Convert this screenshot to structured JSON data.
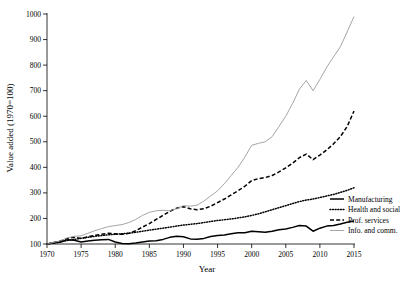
{
  "chart_data": {
    "type": "line",
    "title": "",
    "xlabel": "Year",
    "ylabel": "Value added (1970=100)",
    "xlim": [
      1970,
      2015
    ],
    "ylim": [
      100,
      1000
    ],
    "xticks": [
      1970,
      1975,
      1980,
      1985,
      1990,
      1995,
      2000,
      2005,
      2010,
      2015
    ],
    "yticks": [
      100,
      200,
      300,
      400,
      500,
      600,
      700,
      800,
      900,
      1000
    ],
    "grid": false,
    "legend_position": "right-bottom",
    "x": [
      1970,
      1971,
      1972,
      1973,
      1974,
      1975,
      1976,
      1977,
      1978,
      1979,
      1980,
      1981,
      1982,
      1983,
      1984,
      1985,
      1986,
      1987,
      1988,
      1989,
      1990,
      1991,
      1992,
      1993,
      1994,
      1995,
      1996,
      1997,
      1998,
      1999,
      2000,
      2001,
      2002,
      2003,
      2004,
      2005,
      2006,
      2007,
      2008,
      2009,
      2010,
      2011,
      2012,
      2013,
      2014,
      2015
    ],
    "series": [
      {
        "name": "Manufacturing",
        "style": "solid",
        "color": "#000000",
        "values": [
          100,
          104,
          108,
          117,
          115,
          108,
          112,
          115,
          117,
          118,
          108,
          102,
          101,
          104,
          108,
          112,
          113,
          118,
          126,
          130,
          128,
          120,
          119,
          122,
          129,
          133,
          135,
          140,
          144,
          144,
          150,
          148,
          146,
          150,
          156,
          159,
          165,
          172,
          170,
          150,
          162,
          170,
          172,
          178,
          185,
          190
        ]
      },
      {
        "name": "Health and social",
        "style": "dotted",
        "color": "#000000",
        "values": [
          100,
          104,
          108,
          114,
          118,
          122,
          126,
          130,
          133,
          136,
          138,
          140,
          142,
          146,
          150,
          154,
          158,
          162,
          166,
          170,
          174,
          177,
          180,
          184,
          188,
          192,
          195,
          198,
          202,
          206,
          212,
          218,
          226,
          234,
          242,
          250,
          258,
          266,
          272,
          276,
          282,
          288,
          294,
          302,
          310,
          320
        ]
      },
      {
        "name": "Prof. services",
        "style": "dashed",
        "color": "#000000",
        "values": [
          100,
          106,
          112,
          122,
          126,
          122,
          128,
          134,
          138,
          142,
          140,
          138,
          142,
          152,
          166,
          180,
          196,
          212,
          228,
          240,
          246,
          238,
          234,
          238,
          248,
          262,
          276,
          292,
          308,
          326,
          348,
          356,
          360,
          368,
          382,
          398,
          416,
          438,
          452,
          430,
          448,
          468,
          492,
          520,
          560,
          620
        ]
      },
      {
        "name": "Info. and comm.",
        "style": "thin-gray",
        "color": "#9a9a9a",
        "values": [
          100,
          106,
          113,
          124,
          130,
          132,
          142,
          152,
          160,
          168,
          172,
          176,
          184,
          196,
          212,
          224,
          230,
          232,
          230,
          238,
          250,
          248,
          252,
          268,
          288,
          308,
          336,
          368,
          400,
          440,
          486,
          494,
          500,
          520,
          560,
          600,
          650,
          706,
          740,
          700,
          744,
          792,
          832,
          872,
          930,
          990
        ]
      }
    ]
  },
  "legend": {
    "items": [
      {
        "label": "Manufacturing",
        "style": "solid"
      },
      {
        "label": "Health and social",
        "style": "dotted"
      },
      {
        "label": "Prof. services",
        "style": "dashed"
      },
      {
        "label": "Info. and comm.",
        "style": "thin-gray"
      }
    ]
  }
}
